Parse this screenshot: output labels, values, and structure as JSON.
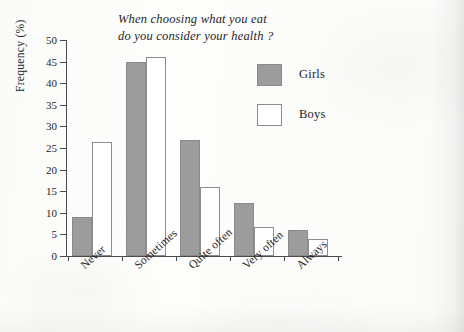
{
  "chart_data": {
    "type": "bar",
    "title": "When choosing what you eat do you consider your health ?",
    "title_line1": "When choosing what you eat",
    "title_line2": "do you consider your health ?",
    "xlabel": "",
    "ylabel": "Frequency (%)",
    "ylim": [
      0,
      50
    ],
    "ytick_step": 5,
    "yticks": [
      0,
      5,
      10,
      15,
      20,
      25,
      30,
      35,
      40,
      45,
      50
    ],
    "ytick_labels": [
      "0",
      "5",
      "10",
      "15",
      "20",
      "25",
      "30",
      "35",
      "40",
      "45",
      "50"
    ],
    "grid": false,
    "legend_position": "upper right",
    "categories": [
      "Never",
      "Sometimes",
      "Quite often",
      "Very often",
      "Always"
    ],
    "series": [
      {
        "name": "Girls",
        "color": "#9c9c9c",
        "values": [
          9,
          45,
          26.8,
          12.3,
          6
        ]
      },
      {
        "name": "Boys",
        "color": "#ffffff",
        "values": [
          26.3,
          46,
          16,
          6.8,
          4
        ]
      }
    ]
  },
  "legend": {
    "items": [
      {
        "label": "Girls",
        "style": "girls"
      },
      {
        "label": "Boys",
        "style": "boys"
      }
    ]
  }
}
